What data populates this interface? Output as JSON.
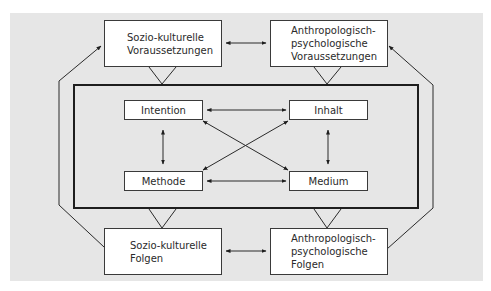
{
  "diagram": {
    "background_color": "#e6e6e6",
    "outer_nodes": {
      "top_left": {
        "lines": [
          "Sozio-kulturelle",
          "Voraussetzungen"
        ]
      },
      "top_right": {
        "lines": [
          "Anthropologisch-",
          "psychologische",
          "Voraussetzungen"
        ]
      },
      "bottom_left": {
        "lines": [
          "Sozio-kulturelle",
          "Folgen"
        ]
      },
      "bottom_right": {
        "lines": [
          "Anthropologisch-",
          "psychologische",
          "Folgen"
        ]
      }
    },
    "inner_nodes": {
      "intention": "Intention",
      "inhalt": "Inhalt",
      "methode": "Methode",
      "medium": "Medium"
    },
    "edges": [
      {
        "from": "Sozio-kulturelle Voraussetzungen",
        "to": "Anthropologisch-psychologische Voraussetzungen",
        "type": "bidirectional"
      },
      {
        "from": "Sozio-kulturelle Folgen",
        "to": "Anthropologisch-psychologische Folgen",
        "type": "bidirectional"
      },
      {
        "from": "Intention",
        "to": "Inhalt",
        "type": "bidirectional"
      },
      {
        "from": "Intention",
        "to": "Methode",
        "type": "bidirectional"
      },
      {
        "from": "Intention",
        "to": "Medium",
        "type": "bidirectional"
      },
      {
        "from": "Inhalt",
        "to": "Methode",
        "type": "bidirectional"
      },
      {
        "from": "Inhalt",
        "to": "Medium",
        "type": "bidirectional"
      },
      {
        "from": "Methode",
        "to": "Medium",
        "type": "bidirectional"
      },
      {
        "from": "Sozio-kulturelle Folgen",
        "to": "Sozio-kulturelle Voraussetzungen",
        "type": "directed"
      },
      {
        "from": "Anthropologisch-psychologische Folgen",
        "to": "Anthropologisch-psychologische Voraussetzungen",
        "type": "directed"
      }
    ]
  }
}
